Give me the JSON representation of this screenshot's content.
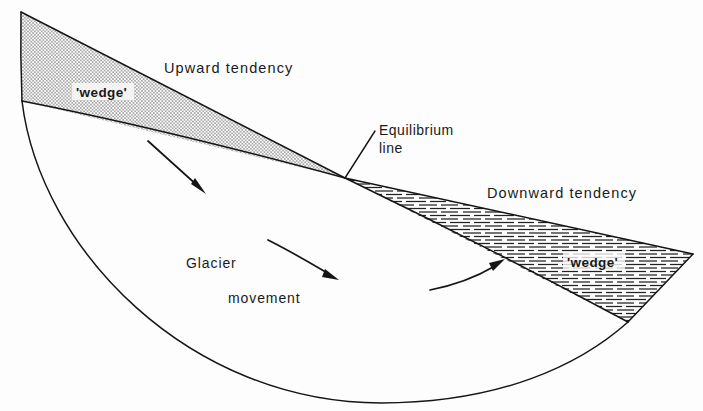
{
  "figure": {
    "background_color": "#fdfdfd",
    "ink_color": "#151515",
    "width": 703,
    "height": 411
  },
  "labels": {
    "upward_tendency": "Upward  tendency",
    "downward_tendency": "Downward  tendency",
    "equilibrium_line_1": "Equilibrium",
    "equilibrium_line_2": "line",
    "glacier": "Glacier",
    "movement": "movement",
    "wedge_left": "'wedge'",
    "wedge_right": "'wedge'"
  },
  "regions": [
    {
      "name": "accumulation-wedge",
      "label": "'wedge'",
      "tendency": "Upward  tendency",
      "fill_pattern": "dotted-stipple",
      "side": "left"
    },
    {
      "name": "ablation-wedge",
      "label": "'wedge'",
      "tendency": "Downward  tendency",
      "fill_pattern": "horizontal-dashes",
      "side": "right"
    }
  ],
  "arrows": [
    {
      "name": "flow-arrow-upper-left",
      "style": "straight",
      "direction": "down-right"
    },
    {
      "name": "flow-arrow-middle",
      "style": "curved",
      "direction": "down-right"
    },
    {
      "name": "flow-arrow-lower-right",
      "style": "curved",
      "direction": "up-right"
    }
  ],
  "annotations": {
    "equilibrium_line_marker": "leader line from label to wedge junction point"
  }
}
